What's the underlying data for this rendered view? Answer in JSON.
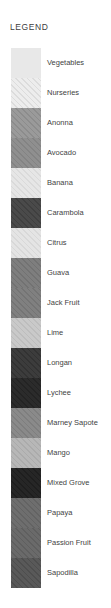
{
  "panel": {
    "title": "LEGEND",
    "background": "#ffffff",
    "text_color": "#3f3f3f",
    "swatch_left": 11,
    "swatch_width": 30,
    "row_height": 30,
    "rows_top": 48
  },
  "legend": {
    "items": [
      {
        "label": "Vegetables",
        "color": "#e8e8e8",
        "hatch": false,
        "hatch_color": "#d8d8d8"
      },
      {
        "label": "Nurseries",
        "color": "#ededed",
        "hatch": true,
        "hatch_color": "#dcdcdc"
      },
      {
        "label": "Anonna",
        "color": "#9a9a9a",
        "hatch": true,
        "hatch_color": "#8c8c8c"
      },
      {
        "label": "Avocado",
        "color": "#8f8f8f",
        "hatch": true,
        "hatch_color": "#838383"
      },
      {
        "label": "Banana",
        "color": "#e6e6e6",
        "hatch": true,
        "hatch_color": "#dadada"
      },
      {
        "label": "Carambola",
        "color": "#4a4a4a",
        "hatch": true,
        "hatch_color": "#3f3f3f"
      },
      {
        "label": "Citrus",
        "color": "#e4e4e4",
        "hatch": true,
        "hatch_color": "#d8d8d8"
      },
      {
        "label": "Guava",
        "color": "#7e7e7e",
        "hatch": true,
        "hatch_color": "#727272"
      },
      {
        "label": "Jack Fruit",
        "color": "#808080",
        "hatch": true,
        "hatch_color": "#747474"
      },
      {
        "label": "Lime",
        "color": "#c9c9c9",
        "hatch": true,
        "hatch_color": "#bdbdbd"
      },
      {
        "label": "Longan",
        "color": "#3c3c3c",
        "hatch": true,
        "hatch_color": "#323232"
      },
      {
        "label": "Lychee",
        "color": "#2b2b2b",
        "hatch": true,
        "hatch_color": "#232323"
      },
      {
        "label": "Marney Sapote",
        "color": "#8a8a8a",
        "hatch": true,
        "hatch_color": "#7e7e7e"
      },
      {
        "label": "Mango",
        "color": "#b7b7b7",
        "hatch": true,
        "hatch_color": "#ababab"
      },
      {
        "label": "Mixed Grove",
        "color": "#262626",
        "hatch": true,
        "hatch_color": "#1e1e1e"
      },
      {
        "label": "Papaya",
        "color": "#6e6e6e",
        "hatch": true,
        "hatch_color": "#636363"
      },
      {
        "label": "Passion Fruit",
        "color": "#6a6a6a",
        "hatch": true,
        "hatch_color": "#5f5f5f"
      },
      {
        "label": "Sapodilla",
        "color": "#595959",
        "hatch": true,
        "hatch_color": "#4e4e4e"
      }
    ]
  }
}
